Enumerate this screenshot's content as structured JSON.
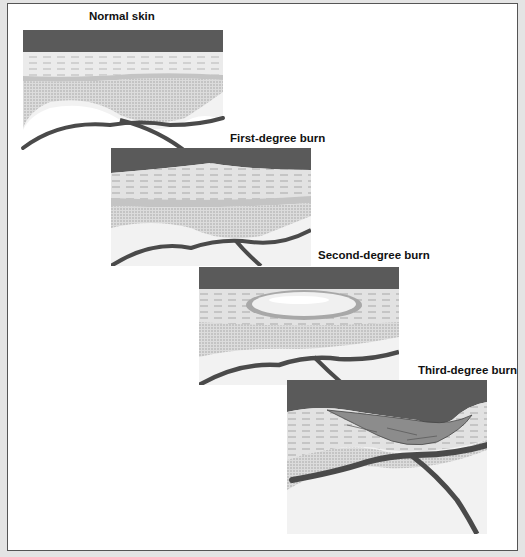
{
  "figure": {
    "panels": [
      {
        "id": "normal",
        "label": "Normal skin"
      },
      {
        "id": "first",
        "label": "First-degree burn"
      },
      {
        "id": "second",
        "label": "Second-degree burn"
      },
      {
        "id": "third",
        "label": "Third-degree burn"
      }
    ]
  },
  "colors": {
    "background": "#ffffff",
    "outer": "#e4e4e4",
    "epidermis_top": "#5a5a5a",
    "dermis": "#e6e6e6",
    "subcutaneous": "#d4d4d4",
    "blood_vessel": "#4a4a4a",
    "blister": "#f0f0f0",
    "char": "#8c8c8c"
  }
}
